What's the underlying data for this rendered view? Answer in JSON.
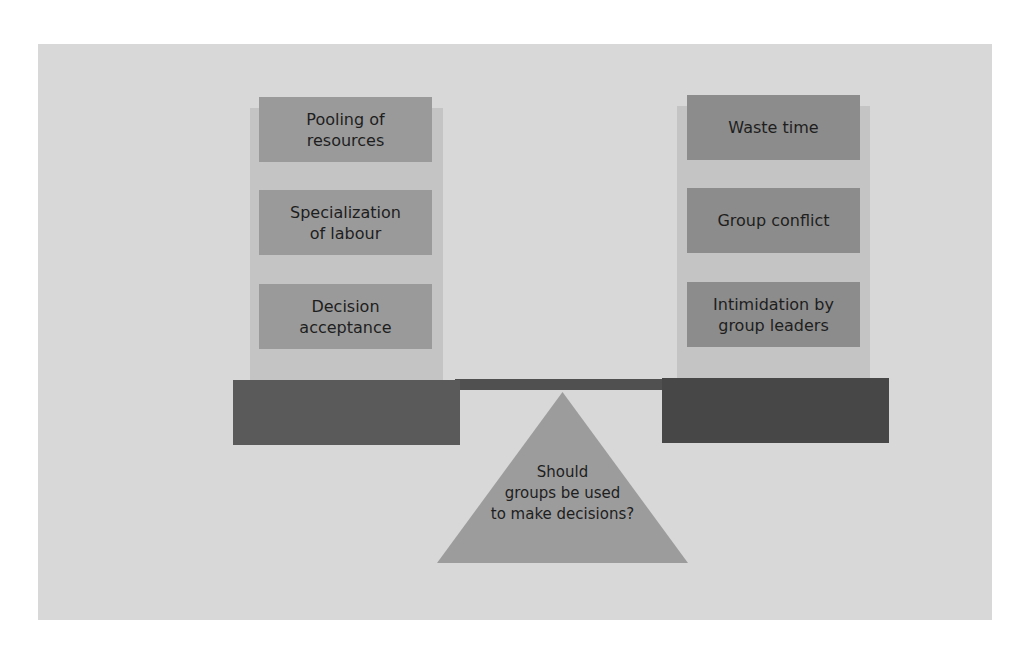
{
  "diagram": {
    "type": "balance-scale",
    "fulcrum_question": "Should groups be used to make decisions?",
    "fulcrum_lines": [
      "Should",
      "groups be used",
      "to make decisions?"
    ],
    "left_side": {
      "items": [
        {
          "lines": [
            "Pooling of",
            "resources"
          ],
          "label": "Pooling of resources"
        },
        {
          "lines": [
            "Specialization",
            "of labour"
          ],
          "label": "Specialization of labour"
        },
        {
          "lines": [
            "Decision",
            "acceptance"
          ],
          "label": "Decision acceptance"
        }
      ]
    },
    "right_side": {
      "items": [
        {
          "lines": [
            "Waste time"
          ],
          "label": "Waste time"
        },
        {
          "lines": [
            "Group conflict"
          ],
          "label": "Group conflict"
        },
        {
          "lines": [
            "Intimidation by",
            "group leaders"
          ],
          "label": "Intimidation by group leaders"
        }
      ]
    },
    "colors": {
      "panel": "#d8d8d8",
      "column_backdrop": "#c4c4c4",
      "left_box": "#9a9a9a",
      "right_box": "#8c8c8c",
      "left_base": "#5a5a5a",
      "right_base": "#474747",
      "fulcrum": "#9c9c9c"
    }
  }
}
